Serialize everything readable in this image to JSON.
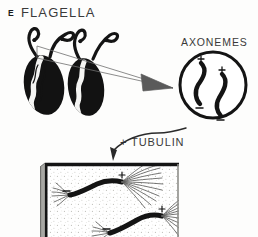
{
  "figure": {
    "panel_letter": "E",
    "title": "FLAGELLA",
    "labels": {
      "flagella": "FLAGELLA",
      "axonemes": "AXONEMES",
      "tubulin": "+ TUBULIN"
    },
    "polarity_marks": {
      "plus": "+",
      "minus": "−"
    },
    "colors": {
      "ink": "#1a1a1a",
      "label_text": "#3a3a3a",
      "background": "#fdfdfc",
      "stipple": "#b9b9b4",
      "frame_dark": "#141414",
      "frame_side": "#a8a8a4",
      "leader_line": "#6e6e6e"
    },
    "stages": [
      {
        "id": "flagellated-cells",
        "name": "Flagellated cells",
        "caption": "FLAGELLA",
        "cell_count": 2,
        "flagella_per_cell": 2
      },
      {
        "id": "isolated-axonemes",
        "name": "Isolated axonemes in circle",
        "caption": "AXONEMES",
        "axoneme_count": 2,
        "end_marks": [
          "+",
          "−"
        ]
      },
      {
        "id": "tubulin-assembly",
        "name": "Axonemes with tubulin added",
        "caption": "+ TUBULIN",
        "axoneme_count": 2,
        "plus_end_growth": "large fan of microtubules",
        "minus_end_growth": "small fan of microtubules"
      }
    ],
    "arrows": [
      {
        "id": "arrow-cells-to-axonemes",
        "from": "flagellated-cells",
        "to": "isolated-axonemes",
        "style": "thin-outline"
      },
      {
        "id": "arrow-axonemes-to-box",
        "from": "isolated-axonemes",
        "to": "tubulin-assembly",
        "style": "curved"
      }
    ]
  }
}
